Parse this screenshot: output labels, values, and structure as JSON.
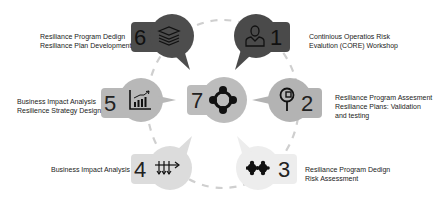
{
  "diagram": {
    "colors": {
      "step1": "#4a4a4a",
      "step2": "#b3b3b3",
      "step3": "#ededed",
      "step4": "#dcdcdc",
      "step5": "#b8b8b8",
      "step6": "#4d4d4d",
      "step7": "#bcbcbc",
      "ring": "#cfcfcf"
    },
    "steps": [
      {
        "number": "1",
        "icon": "person-icon",
        "lines": [
          "Continious Operatios Risk",
          "Evalution (CORE) Workshop"
        ]
      },
      {
        "number": "2",
        "icon": "magnifier-icon",
        "lines": [
          "Resiliance Program Assesment",
          "Resiliance Plans: Validation",
          "and testing"
        ]
      },
      {
        "number": "3",
        "icon": "puzzle-icon",
        "lines": [
          "Resiliance Program Dedign",
          "Risk Assessment"
        ]
      },
      {
        "number": "4",
        "icon": "arrows-icon",
        "lines": [
          "Business Impact Analysis"
        ]
      },
      {
        "number": "5",
        "icon": "chart-icon",
        "lines": [
          "Business Impact Analysis",
          "Resilience Strategy Design"
        ]
      },
      {
        "number": "6",
        "icon": "stack-icon",
        "lines": [
          "Resiliance Program Dedign",
          "Resiliance Plan Development"
        ]
      },
      {
        "number": "7",
        "icon": "cycle-icon",
        "lines": []
      }
    ]
  }
}
